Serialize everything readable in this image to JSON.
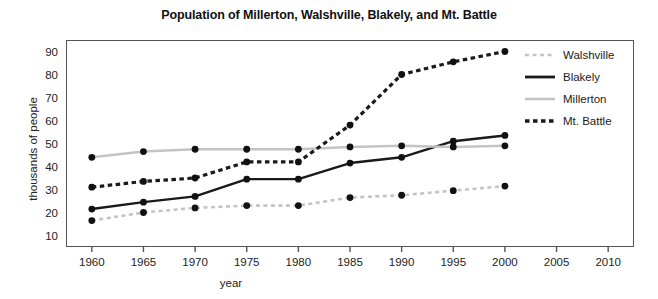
{
  "chart_data": {
    "type": "line",
    "title": "Population of Millerton, Walshville, Blakely, and Mt. Battle",
    "xlabel": "year",
    "ylabel": "thousands of people",
    "x": [
      1960,
      1965,
      1970,
      1975,
      1980,
      1985,
      1990,
      1995,
      2000
    ],
    "xlim": [
      1957.5,
      2012.5
    ],
    "ylim": [
      5,
      95
    ],
    "xticks": [
      1960,
      1965,
      1970,
      1975,
      1980,
      1985,
      1990,
      1995,
      2000,
      2005,
      2010
    ],
    "yticks": [
      10,
      20,
      30,
      40,
      50,
      60,
      70,
      80,
      90
    ],
    "grid": false,
    "legend_position": "right outside",
    "series": [
      {
        "name": "Walshville",
        "color": "#c4c4c4",
        "style": "dashed",
        "marker": "filled-circle",
        "marker_color": "#111111",
        "values": [
          16.5,
          20,
          22,
          23,
          23,
          26.5,
          27.5,
          29.5,
          31.5
        ]
      },
      {
        "name": "Blakely",
        "color": "#1a1a1a",
        "style": "solid",
        "marker": "filled-circle",
        "marker_color": "#111111",
        "values": [
          21.5,
          24.5,
          27,
          34.5,
          34.5,
          41.5,
          44,
          51,
          53.5
        ]
      },
      {
        "name": "Millerton",
        "color": "#c4c4c4",
        "style": "solid",
        "marker": "filled-circle",
        "marker_color": "#111111",
        "values": [
          44,
          46.5,
          47.5,
          47.5,
          47.5,
          48.5,
          49,
          48.5,
          49
        ]
      },
      {
        "name": "Mt. Battle",
        "color": "#1a1a1a",
        "style": "dotted",
        "marker": "filled-circle",
        "marker_color": "#111111",
        "values": [
          31,
          33.5,
          35,
          42,
          42,
          58,
          80,
          85.5,
          90
        ]
      }
    ]
  },
  "legend": {
    "items": [
      {
        "label": "Walshville"
      },
      {
        "label": "Blakely"
      },
      {
        "label": "Millerton"
      },
      {
        "label": "Mt. Battle"
      }
    ]
  },
  "axes": {
    "y_tick_labels": [
      "90",
      "80",
      "70",
      "60",
      "50",
      "40",
      "30",
      "20",
      "10"
    ],
    "x_tick_labels": [
      "1960",
      "1965",
      "1970",
      "1975",
      "1980",
      "1985",
      "1990",
      "1995",
      "2000",
      "2005",
      "2010"
    ]
  }
}
